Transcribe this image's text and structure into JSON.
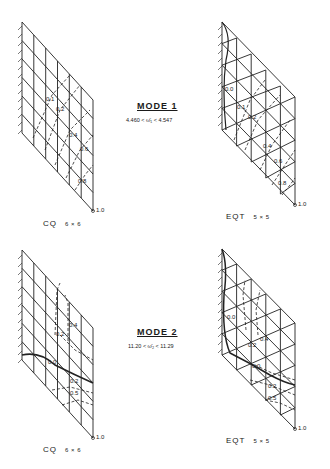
{
  "figure": {
    "modes": [
      {
        "title": "MODE 1",
        "range_text": "4.460 < ω̄₁ < 4.547",
        "panels": [
          {
            "id": "mode1-cq",
            "caption": "CQ",
            "mesh": "6 × 6",
            "contour_labels": [
              "0.1",
              "0.2",
              "0.4",
              "0.6",
              "0.8",
              "1.0"
            ]
          },
          {
            "id": "mode1-eqt",
            "caption": "EQT",
            "mesh": "5 × 5",
            "contour_labels": [
              "0.0",
              "0.1",
              "0.2",
              "0.4",
              "0.6",
              "0.8",
              "1.0"
            ]
          }
        ]
      },
      {
        "title": "MODE 2",
        "range_text": "11.20 < ω̄₂ < 11.29",
        "panels": [
          {
            "id": "mode2-cq",
            "caption": "CQ",
            "mesh": "6 × 6",
            "contour_labels": [
              "0.4",
              "0.2",
              "0.0",
              "0.2",
              "0.5",
              "1.0"
            ]
          },
          {
            "id": "mode2-eqt",
            "caption": "EQT",
            "mesh": "5 × 5",
            "contour_labels": [
              "0.0",
              "0.4",
              "0.2",
              "0.0",
              "0.2",
              "0.5",
              "1.0"
            ]
          }
        ]
      }
    ]
  }
}
